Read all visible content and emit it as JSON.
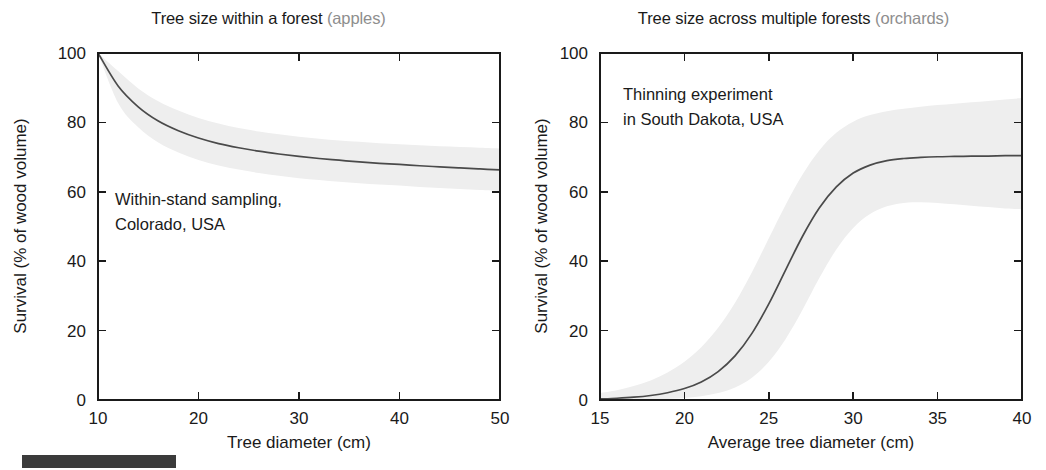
{
  "figure": {
    "footer_bar_color": "#3b3b3b",
    "band_color": "#eeeeee",
    "curve_color": "#4a4a4a",
    "axis_color": "#1a1a1a",
    "muted_color": "#8e8e8e"
  },
  "panels": [
    {
      "id": "left",
      "title_main": "Tree size within a forest ",
      "title_muted": "(apples)",
      "annotation_line1": "Within-stand sampling,",
      "annotation_line2": "Colorado, USA",
      "xlabel": "Tree diameter (cm)",
      "ylabel": "Survival (% of wood volume)",
      "xticks": [
        "10",
        "20",
        "30",
        "40",
        "50"
      ],
      "yticks": [
        "0",
        "20",
        "40",
        "60",
        "80",
        "100"
      ]
    },
    {
      "id": "right",
      "title_main": "Tree size across multiple forests ",
      "title_muted": "(orchards)",
      "annotation_line1": "Thinning experiment",
      "annotation_line2": "in South Dakota, USA",
      "xlabel": "Average tree diameter (cm)",
      "ylabel": "Survival (% of wood volume)",
      "xticks": [
        "15",
        "20",
        "25",
        "30",
        "35",
        "40"
      ],
      "yticks": [
        "0",
        "20",
        "40",
        "60",
        "80",
        "100"
      ]
    }
  ],
  "chart_data": [
    {
      "type": "line",
      "panel": "left",
      "title": "Tree size within a forest (apples)",
      "xlabel": "Tree diameter (cm)",
      "ylabel": "Survival (% of wood volume)",
      "xlim": [
        10,
        50
      ],
      "ylim": [
        0,
        100
      ],
      "xticks": [
        10,
        20,
        30,
        40,
        50
      ],
      "yticks": [
        0,
        20,
        40,
        60,
        80,
        100
      ],
      "grid": false,
      "legend": "none",
      "annotation": "Within-stand sampling, Colorado, USA",
      "x": [
        10,
        12,
        14,
        16,
        18,
        20,
        22,
        24,
        26,
        28,
        30,
        32,
        34,
        36,
        38,
        40,
        42,
        44,
        46,
        48,
        50
      ],
      "series": [
        {
          "name": "mean",
          "values": [
            100.0,
            90.5,
            84.5,
            80.4,
            77.6,
            75.5,
            73.9,
            72.7,
            71.7,
            70.9,
            70.2,
            69.6,
            69.1,
            68.6,
            68.2,
            67.9,
            67.5,
            67.2,
            66.9,
            66.6,
            66.3
          ]
        },
        {
          "name": "upper_band",
          "values": [
            100.0,
            94.8,
            89.8,
            86.1,
            83.4,
            81.3,
            79.7,
            78.4,
            77.4,
            76.6,
            75.9,
            75.3,
            74.8,
            74.4,
            74.0,
            73.7,
            73.4,
            73.1,
            72.9,
            72.7,
            72.5
          ]
        },
        {
          "name": "lower_band",
          "values": [
            100.0,
            85.6,
            78.6,
            74.2,
            71.3,
            69.2,
            67.6,
            66.4,
            65.4,
            64.6,
            63.9,
            63.4,
            62.9,
            62.5,
            62.1,
            61.8,
            61.4,
            61.1,
            60.8,
            60.5,
            60.2
          ]
        }
      ]
    },
    {
      "type": "line",
      "panel": "right",
      "title": "Tree size across multiple forests (orchards)",
      "xlabel": "Average tree diameter (cm)",
      "ylabel": "Survival (% of wood volume)",
      "xlim": [
        15,
        40
      ],
      "ylim": [
        0,
        100
      ],
      "xticks": [
        15,
        20,
        25,
        30,
        35,
        40
      ],
      "yticks": [
        0,
        20,
        40,
        60,
        80,
        100
      ],
      "grid": false,
      "legend": "none",
      "annotation": "Thinning experiment in South Dakota, USA",
      "x": [
        15,
        16,
        17,
        18,
        19,
        20,
        21,
        22,
        23,
        24,
        25,
        26,
        27,
        28,
        29,
        30,
        31,
        32,
        33,
        34,
        35,
        36,
        37,
        38,
        39,
        40
      ],
      "series": [
        {
          "name": "mean",
          "values": [
            0.3,
            0.5,
            0.8,
            1.3,
            2.1,
            3.3,
            5.2,
            8.2,
            12.7,
            19.2,
            27.7,
            37.5,
            47.2,
            55.4,
            61.4,
            65.4,
            67.7,
            69.0,
            69.6,
            69.9,
            70.1,
            70.2,
            70.3,
            70.3,
            70.4,
            70.4
          ]
        },
        {
          "name": "upper_band",
          "values": [
            2.0,
            2.8,
            4.0,
            5.6,
            7.9,
            11.0,
            15.2,
            20.8,
            28.0,
            36.8,
            46.6,
            56.3,
            65.0,
            72.0,
            77.0,
            80.2,
            82.1,
            83.2,
            83.9,
            84.5,
            85.0,
            85.4,
            85.8,
            86.2,
            86.6,
            87.0
          ]
        },
        {
          "name": "lower_band",
          "values": [
            0.0,
            0.0,
            0.1,
            0.2,
            0.3,
            0.6,
            1.1,
            2.0,
            3.6,
            6.4,
            11.0,
            17.6,
            26.0,
            35.2,
            43.4,
            49.6,
            53.6,
            55.8,
            56.8,
            57.0,
            56.8,
            56.4,
            56.0,
            55.6,
            55.2,
            55.0
          ]
        }
      ]
    }
  ]
}
